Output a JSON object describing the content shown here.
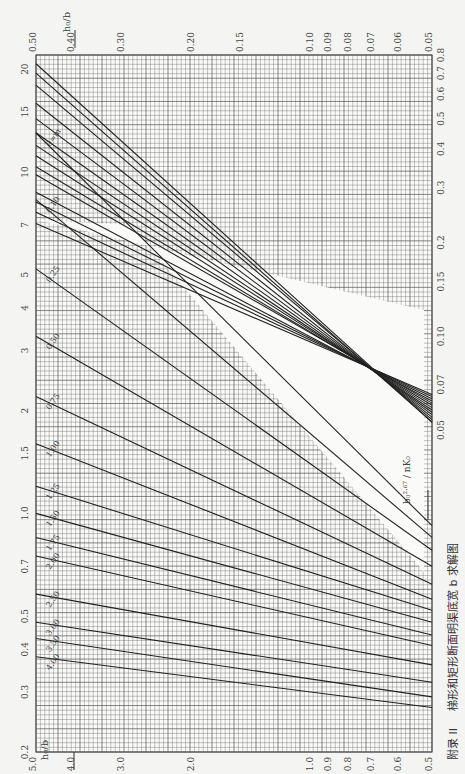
{
  "caption": {
    "appendix": "附录 II",
    "title": "梯形和矩形断面明渠底宽 b 求解图"
  },
  "chart_data": [
    {
      "type": "line",
      "name": "lower_chart",
      "title": "梯形和矩形断面明渠底宽 b 求解图 (large h0/b range)",
      "xlabel": "b0^2.67 / (n K0)",
      "ylabel": "h0 / b",
      "xscale": "log",
      "yscale": "log",
      "x_ticks": [
        "0.2",
        "0.3",
        "0.4",
        "0.5",
        "0.7",
        "1.0",
        "1.5",
        "2",
        "3",
        "4",
        "5",
        "7",
        "10",
        "15",
        "20"
      ],
      "x_range": [
        0.2,
        22
      ],
      "y_ticks": [
        "5.0",
        "4.0",
        "3.0",
        "2.0",
        "1.0",
        "0.9",
        "0.8",
        "0.7",
        "0.6",
        "0.5"
      ],
      "y_range": [
        0.5,
        5.0
      ],
      "series_label_param": "m",
      "series": [
        {
          "name": "0=m",
          "x": [
            0.92,
            13.0
          ],
          "y": [
            0.5,
            5.0
          ]
        },
        {
          "name": "0.10",
          "x": [
            0.85,
            8.3
          ],
          "y": [
            0.5,
            5.0
          ]
        },
        {
          "name": "0.25",
          "x": [
            0.78,
            5.2
          ],
          "y": [
            0.5,
            5.0
          ]
        },
        {
          "name": "0.50",
          "x": [
            0.7,
            3.3
          ],
          "y": [
            0.5,
            5.0
          ]
        },
        {
          "name": "0.75",
          "x": [
            0.62,
            2.2
          ],
          "y": [
            0.5,
            5.0
          ]
        },
        {
          "name": "1.00",
          "x": [
            0.56,
            1.6
          ],
          "y": [
            0.5,
            5.0
          ]
        },
        {
          "name": "1.25",
          "x": [
            0.52,
            1.2
          ],
          "y": [
            0.5,
            5.0
          ]
        },
        {
          "name": "1.50",
          "x": [
            0.48,
            1.0
          ],
          "y": [
            0.5,
            5.0
          ]
        },
        {
          "name": "1.75",
          "x": [
            0.44,
            0.85
          ],
          "y": [
            0.5,
            5.0
          ]
        },
        {
          "name": "2.00",
          "x": [
            0.41,
            0.75
          ],
          "y": [
            0.5,
            5.0
          ]
        },
        {
          "name": "2.50",
          "x": [
            0.36,
            0.58
          ],
          "y": [
            0.5,
            5.0
          ]
        },
        {
          "name": "3.00",
          "x": [
            0.32,
            0.48
          ],
          "y": [
            0.5,
            5.0
          ]
        },
        {
          "name": "3.50",
          "x": [
            0.29,
            0.43
          ],
          "y": [
            0.5,
            5.0
          ]
        },
        {
          "name": "4.00",
          "x": [
            0.27,
            0.38
          ],
          "y": [
            0.5,
            5.0
          ]
        }
      ]
    },
    {
      "type": "line",
      "name": "upper_chart",
      "title": "梯形和矩形断面明渠底宽 b 求解图 (small h0/b range)",
      "xlabel": "b0^2.67 / (n K0)",
      "ylabel": "h0 / b",
      "xscale": "log",
      "yscale": "log",
      "x_ticks": [
        "0.05",
        "0.07",
        "0.10",
        "0.15",
        "0.2",
        "0.3",
        "0.4",
        "0.5",
        "0.6",
        "0.7",
        "0.8"
      ],
      "x_range": [
        0.05,
        0.8
      ],
      "y_ticks": [
        "0.50",
        "0.40",
        "0.30",
        "0.20",
        "0.15",
        "0.10",
        "0.09",
        "0.08",
        "0.07",
        "0.06",
        "0.05"
      ],
      "y_range": [
        0.05,
        0.5
      ],
      "series_label_param": "m",
      "series": [
        {
          "name": "0=m",
          "x": [
            0.053,
            0.75
          ],
          "y": [
            0.05,
            0.5
          ]
        },
        {
          "name": "0.10",
          "x": [
            0.053,
            0.7
          ],
          "y": [
            0.05,
            0.5
          ]
        },
        {
          "name": "0.25",
          "x": [
            0.054,
            0.64
          ],
          "y": [
            0.05,
            0.5
          ]
        },
        {
          "name": "0.50",
          "x": [
            0.055,
            0.56
          ],
          "y": [
            0.05,
            0.5
          ]
        },
        {
          "name": "0.75",
          "x": [
            0.056,
            0.5
          ],
          "y": [
            0.05,
            0.5
          ]
        },
        {
          "name": "1.00",
          "x": [
            0.057,
            0.45
          ],
          "y": [
            0.05,
            0.5
          ]
        },
        {
          "name": "1.25",
          "x": [
            0.058,
            0.41
          ],
          "y": [
            0.05,
            0.5
          ]
        },
        {
          "name": "1.50",
          "x": [
            0.059,
            0.38
          ],
          "y": [
            0.05,
            0.5
          ]
        },
        {
          "name": "1.75",
          "x": [
            0.06,
            0.35
          ],
          "y": [
            0.05,
            0.5
          ]
        },
        {
          "name": "2.00",
          "x": [
            0.061,
            0.33
          ],
          "y": [
            0.05,
            0.5
          ]
        },
        {
          "name": "2.50",
          "x": [
            0.062,
            0.29
          ],
          "y": [
            0.05,
            0.5
          ]
        },
        {
          "name": "3.00",
          "x": [
            0.063,
            0.27
          ],
          "y": [
            0.05,
            0.5
          ]
        },
        {
          "name": "3.50",
          "x": [
            0.064,
            0.25
          ],
          "y": [
            0.05,
            0.5
          ]
        },
        {
          "name": "4.00",
          "x": [
            0.065,
            0.23
          ],
          "y": [
            0.05,
            0.5
          ]
        }
      ]
    }
  ],
  "axes": {
    "top_label": "h0/b ←",
    "bottom_label": "h0/b ←",
    "x_label": "→ b0^2.67 / nK0",
    "top_ticks": [
      "0.50",
      "0.40",
      "0.30",
      "0.20",
      "0.15",
      "0.10",
      "0.09",
      "0.08",
      "0.07",
      "0.06",
      "0.05"
    ],
    "bottom_ticks": [
      "5.0",
      "4.0",
      "3.0",
      "2.0",
      "1.0",
      "0.9",
      "0.8",
      "0.7",
      "0.6",
      "0.5"
    ],
    "left_ticks": [
      "0.2",
      "0.3",
      "0.4",
      "0.5",
      "0.7",
      "1.0",
      "1.5",
      "2",
      "3",
      "4",
      "5",
      "7",
      "10",
      "15",
      "20"
    ],
    "right_ticks": [
      "0.05",
      "0.07",
      "0.10",
      "0.15",
      "0.2",
      "0.3",
      "0.4",
      "0.5",
      "0.6",
      "0.7",
      "0.8"
    ]
  }
}
